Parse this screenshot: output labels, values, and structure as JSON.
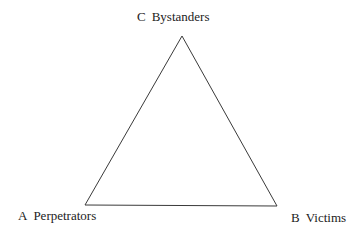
{
  "diagram": {
    "type": "triangle",
    "stroke_color": "#3a3a3a",
    "vertices": {
      "C": {
        "letter": "C",
        "label": "Bystanders",
        "x": 182,
        "y": 36
      },
      "A": {
        "letter": "A",
        "label": "Perpetrators",
        "x": 85,
        "y": 205
      },
      "B": {
        "letter": "B",
        "label": "Victims",
        "x": 277,
        "y": 206
      }
    }
  }
}
